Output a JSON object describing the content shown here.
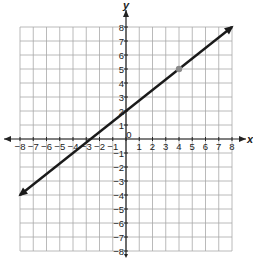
{
  "chart_data": {
    "type": "line",
    "title": "",
    "xlabel": "x",
    "ylabel": "y",
    "xlim": [
      -8,
      8
    ],
    "ylim": [
      -8,
      8
    ],
    "grid": true,
    "x_ticks": [
      "-8",
      "-7",
      "-6",
      "-5",
      "-4",
      "-3",
      "-2",
      "-1",
      "0",
      "1",
      "2",
      "3",
      "4",
      "5",
      "6",
      "7",
      "8"
    ],
    "y_ticks": [
      "-8",
      "-7",
      "-6",
      "-5",
      "-4",
      "-3",
      "-2",
      "-1",
      "1",
      "2",
      "3",
      "4",
      "5",
      "6",
      "7",
      "8"
    ],
    "series": [
      {
        "name": "line",
        "equation": "y = 0.75x + 2",
        "slope": 0.75,
        "intercept": 2,
        "x": [
          -8,
          8
        ],
        "y": [
          -4,
          8
        ],
        "arrows_both_ends": true,
        "color": "#1a1a1a"
      }
    ],
    "highlighted_points": [
      {
        "x": 4,
        "y": 5,
        "color": "#8a8a8a"
      }
    ],
    "origin_label": "0"
  },
  "colors": {
    "grid": "#a8a8a8",
    "axis": "#222222",
    "line": "#1a1a1a",
    "point": "#8a8a8a"
  }
}
